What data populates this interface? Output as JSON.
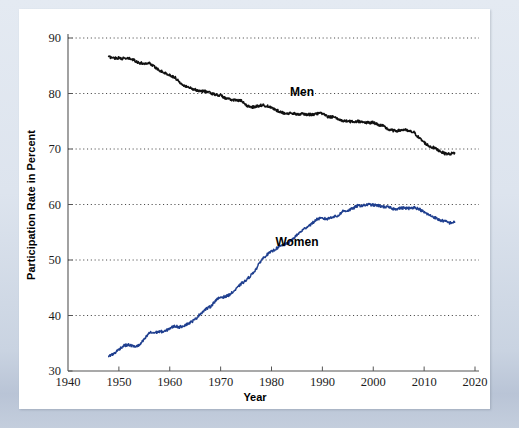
{
  "figure": {
    "background_color": "#ffffff",
    "page_background_color": "#ccd5e2"
  },
  "chart_data": {
    "type": "line",
    "title": "",
    "subtitle": "",
    "xlabel": "Year",
    "ylabel": "Participation Rate in Percent",
    "xlim": [
      1940,
      2020
    ],
    "ylim": [
      30,
      90
    ],
    "xticks": [
      1940,
      1950,
      1960,
      1970,
      1980,
      1990,
      2000,
      2010,
      2020
    ],
    "yticks": [
      30,
      40,
      50,
      60,
      70,
      80,
      90
    ],
    "xtick_labels": [
      "1940",
      "1950",
      "1960",
      "1970",
      "1980",
      "1990",
      "2000",
      "2010",
      "2020"
    ],
    "ytick_labels": [
      "30",
      "40",
      "50",
      "60",
      "70",
      "80",
      "90"
    ],
    "grid": "horizontal-dotted",
    "legend_position": "inline-annotation",
    "annotations": [
      {
        "text": "Men",
        "x": 1986,
        "y": 79.6,
        "color": "#000000"
      },
      {
        "text": "Women",
        "x": 1985,
        "y": 52.6,
        "color": "#000000"
      }
    ],
    "series": [
      {
        "name": "Men",
        "color": "#111111",
        "x": [
          1948,
          1949,
          1950,
          1951,
          1952,
          1953,
          1954,
          1955,
          1956,
          1957,
          1958,
          1959,
          1960,
          1961,
          1962,
          1963,
          1964,
          1965,
          1966,
          1967,
          1968,
          1969,
          1970,
          1971,
          1972,
          1973,
          1974,
          1975,
          1976,
          1977,
          1978,
          1979,
          1980,
          1981,
          1982,
          1983,
          1984,
          1985,
          1986,
          1987,
          1988,
          1989,
          1990,
          1991,
          1992,
          1993,
          1994,
          1995,
          1996,
          1997,
          1998,
          1999,
          2000,
          2001,
          2002,
          2003,
          2004,
          2005,
          2006,
          2007,
          2008,
          2009,
          2010,
          2011,
          2012,
          2013,
          2014,
          2015,
          2016
        ],
        "values": [
          86.6,
          86.4,
          86.4,
          86.3,
          86.3,
          86.0,
          85.5,
          85.4,
          85.5,
          84.8,
          84.2,
          83.7,
          83.3,
          82.9,
          82.0,
          81.4,
          81.0,
          80.7,
          80.4,
          80.4,
          80.1,
          79.8,
          79.7,
          79.1,
          78.9,
          78.8,
          78.7,
          77.9,
          77.5,
          77.7,
          77.9,
          77.8,
          77.4,
          77.0,
          76.6,
          76.4,
          76.4,
          76.3,
          76.3,
          76.2,
          76.2,
          76.4,
          76.4,
          75.8,
          75.8,
          75.4,
          75.1,
          75.0,
          74.9,
          75.0,
          74.9,
          74.7,
          74.8,
          74.4,
          74.1,
          73.5,
          73.3,
          73.3,
          73.5,
          73.2,
          73.0,
          72.0,
          71.2,
          70.5,
          70.2,
          69.7,
          69.2,
          69.1,
          69.3
        ]
      },
      {
        "name": "Women",
        "color": "#1f3f8f",
        "x": [
          1948,
          1949,
          1950,
          1951,
          1952,
          1953,
          1954,
          1955,
          1956,
          1957,
          1958,
          1959,
          1960,
          1961,
          1962,
          1963,
          1964,
          1965,
          1966,
          1967,
          1968,
          1969,
          1970,
          1971,
          1972,
          1973,
          1974,
          1975,
          1976,
          1977,
          1978,
          1979,
          1980,
          1981,
          1982,
          1983,
          1984,
          1985,
          1986,
          1987,
          1988,
          1989,
          1990,
          1991,
          1992,
          1993,
          1994,
          1995,
          1996,
          1997,
          1998,
          1999,
          2000,
          2001,
          2002,
          2003,
          2004,
          2005,
          2006,
          2007,
          2008,
          2009,
          2010,
          2011,
          2012,
          2013,
          2014,
          2015,
          2016
        ],
        "values": [
          32.7,
          33.1,
          33.9,
          34.6,
          34.7,
          34.4,
          34.6,
          35.7,
          36.9,
          36.9,
          37.1,
          37.1,
          37.7,
          38.1,
          37.9,
          38.3,
          38.7,
          39.3,
          40.3,
          41.1,
          41.6,
          42.7,
          43.3,
          43.4,
          43.9,
          44.7,
          45.7,
          46.3,
          47.3,
          48.4,
          50.0,
          50.9,
          51.5,
          52.1,
          52.6,
          52.9,
          53.6,
          54.5,
          55.3,
          56.0,
          56.6,
          57.4,
          57.5,
          57.4,
          57.8,
          57.9,
          58.8,
          58.9,
          59.3,
          59.8,
          59.8,
          60.0,
          59.9,
          59.8,
          59.6,
          59.5,
          59.2,
          59.3,
          59.4,
          59.3,
          59.5,
          59.2,
          58.6,
          58.1,
          57.7,
          57.2,
          57.0,
          56.7,
          56.8
        ]
      }
    ]
  }
}
